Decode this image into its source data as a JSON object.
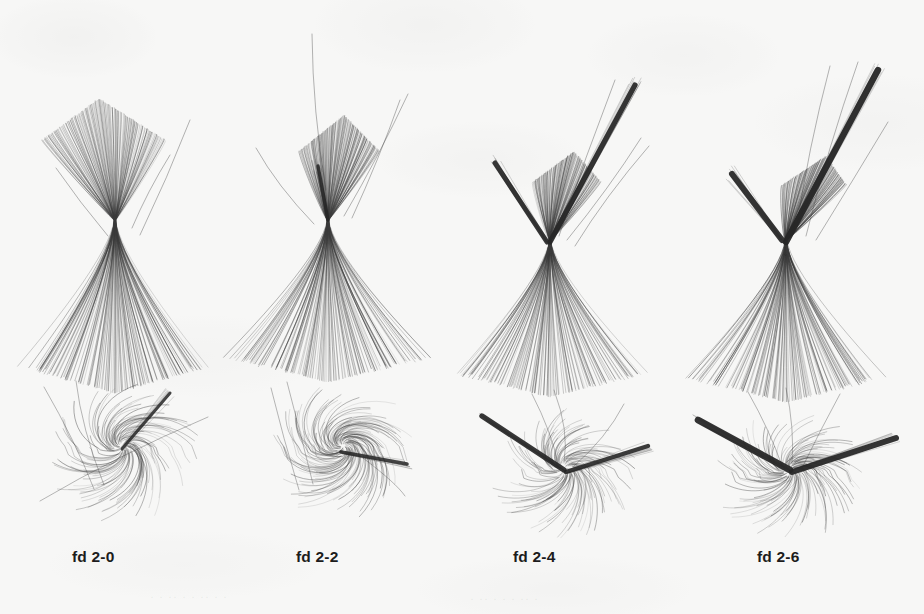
{
  "figure": {
    "kind": "fiber-tract-streamline-panels",
    "background_color": "#f7f7f6",
    "ink_color": "#3a3a3a",
    "trunk_color": "#262626",
    "rows": 2,
    "columns": 4
  },
  "captions": [
    {
      "label": "fd 2-0",
      "x": 72
    },
    {
      "label": "fd 2-2",
      "x": 296
    },
    {
      "label": "fd 2-4",
      "x": 513
    },
    {
      "label": "fd 2-6",
      "x": 757
    }
  ],
  "panels_top": [
    {
      "name": "fd-2-0-top",
      "x": 20,
      "y": 60,
      "w": 200,
      "h": 300,
      "view": "front",
      "seed": 11,
      "form": "hourglass",
      "waist_x": 95,
      "waist_y": 160,
      "upper_spread": 62,
      "upper_len": 110,
      "upper_tilt": -4,
      "lower_spread": 88,
      "lower_len": 160,
      "n_lines": 120,
      "trunks": [],
      "strays": [
        {
          "x1": 170,
          "y1": 60,
          "x2": 120,
          "y2": 175
        },
        {
          "x1": 150,
          "y1": 95,
          "x2": 112,
          "y2": 168
        },
        {
          "x1": 36,
          "y1": 108,
          "x2": 88,
          "y2": 176
        }
      ]
    },
    {
      "name": "fd-2-2-top",
      "x": 240,
      "y": 20,
      "w": 200,
      "h": 340,
      "view": "front",
      "seed": 23,
      "form": "fan",
      "waist_x": 88,
      "waist_y": 200,
      "upper_spread": 40,
      "upper_len": 95,
      "upper_tilt": 4,
      "lower_spread": 95,
      "lower_len": 150,
      "n_lines": 120,
      "trunks": [
        {
          "x1": 88,
          "y1": 200,
          "x2": 78,
          "y2": 146,
          "w": 3.4,
          "o": 0.88
        }
      ],
      "strays": [
        {
          "x1": 72,
          "y1": 14,
          "x2": 86,
          "y2": 170
        },
        {
          "x1": 168,
          "y1": 74,
          "x2": 104,
          "y2": 196
        },
        {
          "x1": 160,
          "y1": 80,
          "x2": 112,
          "y2": 198
        },
        {
          "x1": 16,
          "y1": 128,
          "x2": 74,
          "y2": 204
        }
      ]
    },
    {
      "name": "fd-2-4-top",
      "x": 455,
      "y": 50,
      "w": 210,
      "h": 310,
      "view": "front",
      "seed": 37,
      "form": "y-branch",
      "waist_x": 95,
      "waist_y": 190,
      "upper_spread": 34,
      "upper_len": 80,
      "upper_tilt": 6,
      "lower_spread": 92,
      "lower_len": 145,
      "n_lines": 120,
      "trunks": [
        {
          "x1": 95,
          "y1": 192,
          "x2": 180,
          "y2": 35,
          "w": 5.2,
          "o": 0.93
        },
        {
          "x1": 92,
          "y1": 192,
          "x2": 40,
          "y2": 113,
          "w": 5.0,
          "o": 0.92
        }
      ],
      "strays": [
        {
          "x1": 160,
          "y1": 30,
          "x2": 104,
          "y2": 186
        },
        {
          "x1": 186,
          "y1": 88,
          "x2": 112,
          "y2": 190
        },
        {
          "x1": 194,
          "y1": 96,
          "x2": 120,
          "y2": 196
        }
      ]
    },
    {
      "name": "fd-2-6-top",
      "x": 690,
      "y": 40,
      "w": 210,
      "h": 320,
      "view": "front",
      "seed": 53,
      "form": "y-branch",
      "waist_x": 96,
      "waist_y": 200,
      "upper_spread": 32,
      "upper_len": 76,
      "upper_tilt": 10,
      "lower_spread": 95,
      "lower_len": 150,
      "n_lines": 120,
      "trunks": [
        {
          "x1": 96,
          "y1": 202,
          "x2": 188,
          "y2": 30,
          "w": 6.4,
          "o": 0.95
        },
        {
          "x1": 92,
          "y1": 200,
          "x2": 42,
          "y2": 134,
          "w": 6.0,
          "o": 0.93
        }
      ],
      "strays": [
        {
          "x1": 140,
          "y1": 26,
          "x2": 106,
          "y2": 192
        },
        {
          "x1": 168,
          "y1": 22,
          "x2": 116,
          "y2": 196
        },
        {
          "x1": 198,
          "y1": 82,
          "x2": 126,
          "y2": 200
        }
      ]
    }
  ],
  "panels_bottom": [
    {
      "name": "fd-2-0-bottom",
      "x": 30,
      "y": 365,
      "w": 190,
      "h": 150,
      "view": "axial",
      "seed": 71,
      "cx": 92,
      "cy": 82,
      "swirl": 1.0,
      "radius": 60,
      "n_lines": 110,
      "trunks": [
        {
          "x1": 92,
          "y1": 84,
          "x2": 140,
          "y2": 28,
          "w": 3.0,
          "o": 0.85
        }
      ],
      "strays": [
        {
          "x1": 14,
          "y1": 22,
          "x2": 64,
          "y2": 124
        },
        {
          "x1": 46,
          "y1": 16,
          "x2": 74,
          "y2": 120
        },
        {
          "x1": 10,
          "y1": 136,
          "x2": 178,
          "y2": 52
        }
      ]
    },
    {
      "name": "fd-2-2-bottom",
      "x": 255,
      "y": 372,
      "w": 185,
      "h": 145,
      "view": "axial",
      "seed": 89,
      "cx": 88,
      "cy": 74,
      "swirl": 1.35,
      "radius": 58,
      "n_lines": 120,
      "trunks": [
        {
          "x1": 86,
          "y1": 80,
          "x2": 152,
          "y2": 92,
          "w": 3.6,
          "o": 0.86
        }
      ],
      "strays": [
        {
          "x1": 16,
          "y1": 16,
          "x2": 44,
          "y2": 118
        },
        {
          "x1": 32,
          "y1": 10,
          "x2": 58,
          "y2": 112
        },
        {
          "x1": 150,
          "y1": 124,
          "x2": 108,
          "y2": 86
        }
      ]
    },
    {
      "name": "fd-2-4-bottom",
      "x": 468,
      "y": 386,
      "w": 200,
      "h": 140,
      "view": "axial",
      "seed": 101,
      "cx": 96,
      "cy": 82,
      "swirl": 0.75,
      "radius": 56,
      "n_lines": 115,
      "trunks": [
        {
          "x1": 96,
          "y1": 84,
          "x2": 14,
          "y2": 30,
          "w": 5.4,
          "o": 0.92
        },
        {
          "x1": 98,
          "y1": 86,
          "x2": 180,
          "y2": 60,
          "w": 4.4,
          "o": 0.9
        }
      ],
      "strays": [
        {
          "x1": 64,
          "y1": 8,
          "x2": 90,
          "y2": 78
        },
        {
          "x1": 86,
          "y1": 4,
          "x2": 96,
          "y2": 76
        },
        {
          "x1": 156,
          "y1": 18,
          "x2": 106,
          "y2": 80
        }
      ]
    },
    {
      "name": "fd-2-6-bottom",
      "x": 690,
      "y": 386,
      "w": 215,
      "h": 140,
      "view": "axial",
      "seed": 127,
      "cx": 100,
      "cy": 84,
      "swirl": 0.7,
      "radius": 58,
      "n_lines": 115,
      "trunks": [
        {
          "x1": 100,
          "y1": 84,
          "x2": 8,
          "y2": 34,
          "w": 6.6,
          "o": 0.94
        },
        {
          "x1": 102,
          "y1": 86,
          "x2": 206,
          "y2": 52,
          "w": 6.0,
          "o": 0.93
        }
      ],
      "strays": [
        {
          "x1": 58,
          "y1": 6,
          "x2": 92,
          "y2": 80
        },
        {
          "x1": 96,
          "y1": 2,
          "x2": 102,
          "y2": 78
        },
        {
          "x1": 150,
          "y1": 8,
          "x2": 112,
          "y2": 82
        }
      ]
    }
  ],
  "bleed_through": [
    {
      "text": "·  ·  ··  ·   ·  ··  ·  ·",
      "x": 150,
      "y": 590
    },
    {
      "text": "·   ··  ·  ·   ·   ··  ·",
      "x": 470,
      "y": 592
    }
  ]
}
